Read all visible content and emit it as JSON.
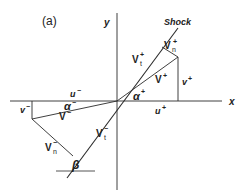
{
  "figure": {
    "panel_label": "(a)",
    "axes": {
      "x_label": "x",
      "y_label": "y"
    },
    "shock_label": "Shock",
    "upstream": {
      "u_label": "u",
      "u_sup": "−",
      "v_label": "v",
      "v_sup": "−",
      "V_label": "V",
      "V_sup": "−",
      "Vn_label": "V",
      "Vn_sub": "n",
      "Vn_sup": "−",
      "Vt_label": "V",
      "Vt_sub": "t",
      "Vt_sup": "−",
      "alpha_label": "α",
      "alpha_sup": "−"
    },
    "downstream": {
      "u_label": "u",
      "u_sup": "+",
      "v_label": "v",
      "v_sup": "+",
      "V_label": "V",
      "V_sup": "+",
      "Vn_label": "V",
      "Vn_sub": "n",
      "Vn_sup": "+",
      "Vt_label": "V",
      "Vt_sub": "t",
      "Vt_sup": "+",
      "alpha_label": "α",
      "alpha_sup": "+"
    },
    "beta_label": "β",
    "colors": {
      "line": "#2a2a2a",
      "text": "#222222",
      "background": "#ffffff"
    }
  }
}
